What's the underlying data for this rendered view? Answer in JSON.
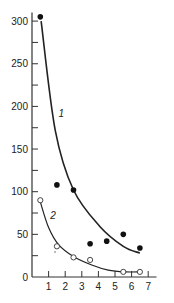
{
  "chart_data": {
    "type": "scatter",
    "title": "",
    "xlabel": "",
    "ylabel": "",
    "xlim": [
      0,
      7.5
    ],
    "ylim": [
      0,
      310
    ],
    "grid": false,
    "x_ticks": [
      1,
      2,
      3,
      4,
      5,
      6,
      7
    ],
    "y_ticks_labeled": [
      0,
      50,
      100,
      150,
      200,
      250,
      300
    ],
    "y_ticks_minor": [
      25,
      75,
      125,
      175,
      225,
      275
    ],
    "series": [
      {
        "name": "1",
        "marker": "filled-circle",
        "points": [
          {
            "x": 0.5,
            "y": 305
          },
          {
            "x": 1.5,
            "y": 108
          },
          {
            "x": 2.5,
            "y": 102
          },
          {
            "x": 3.5,
            "y": 39
          },
          {
            "x": 4.5,
            "y": 42
          },
          {
            "x": 5.5,
            "y": 50
          },
          {
            "x": 6.5,
            "y": 34
          }
        ],
        "fit_curve": [
          {
            "x": 0.55,
            "y": 300
          },
          {
            "x": 1.4,
            "y": 172
          },
          {
            "x": 2.5,
            "y": 102
          },
          {
            "x": 4.1,
            "y": 59
          },
          {
            "x": 5.5,
            "y": 36
          },
          {
            "x": 6.5,
            "y": 28
          }
        ]
      },
      {
        "name": "2",
        "marker": "open-circle",
        "points": [
          {
            "x": 0.5,
            "y": 90
          },
          {
            "x": 1.5,
            "y": 36
          },
          {
            "x": 2.5,
            "y": 23
          },
          {
            "x": 3.5,
            "y": 20
          },
          {
            "x": 5.5,
            "y": 6
          },
          {
            "x": 6.5,
            "y": 6
          }
        ],
        "fit_curve": [
          {
            "x": 0.5,
            "y": 88
          },
          {
            "x": 1.0,
            "y": 58
          },
          {
            "x": 1.6,
            "y": 38
          },
          {
            "x": 2.5,
            "y": 24
          },
          {
            "x": 3.6,
            "y": 14
          },
          {
            "x": 4.6,
            "y": 8
          },
          {
            "x": 5.6,
            "y": 6
          },
          {
            "x": 6.6,
            "y": 6
          }
        ]
      }
    ],
    "annotations": [
      {
        "text": "1",
        "x": 1.6,
        "y": 188
      },
      {
        "text": "2",
        "x": 1.1,
        "y": 68
      }
    ]
  }
}
